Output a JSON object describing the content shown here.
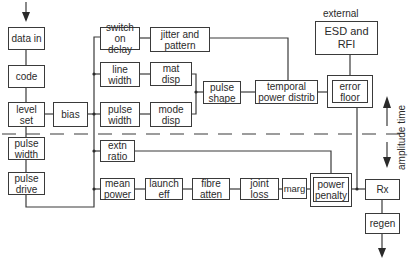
{
  "diagram": {
    "blocks": {
      "data_in": "data in",
      "code": "code",
      "level_set": "level\nset",
      "pulse_width_left": "pulse\nwidth",
      "pulse_drive": "pulse\ndrive",
      "bias": "bias",
      "switch_on_delay": "switch\non delay",
      "jitter_and_pattern": "jitter and\npattern",
      "line_width": "line\nwidth",
      "mat_disp": "mat\ndisp",
      "pulse_width_mid": "pulse\nwidth",
      "mode_disp": "mode\ndisp",
      "pulse_shape": "pulse\nshape",
      "temporal_power_distrib": "temporal\npower distrib",
      "esd_and_rfi": "ESD and\nRFI",
      "error_floor": "error\nfloor",
      "extn_ratio": "extn\nratio",
      "mean_power": "mean\npower",
      "launch_eff": "launch\neff",
      "fibre_atten": "fibre\natten",
      "joint_loss": "joint\nloss",
      "marg": "marg",
      "power_penalty": "power\npenalty",
      "rx": "Rx",
      "regen": "regen"
    },
    "labels": {
      "external": "external",
      "amplitude_time": "amplitude time"
    }
  }
}
